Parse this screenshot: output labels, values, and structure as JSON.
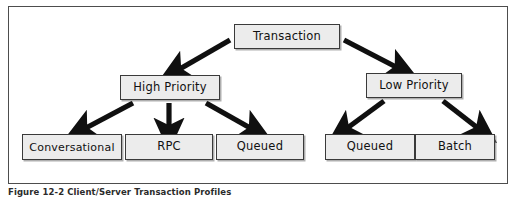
{
  "figure": {
    "caption": "Figure 12-2  Client/Server Transaction Profiles",
    "frame_color": "#4d4d4d",
    "background": "#ffffff"
  },
  "diagram": {
    "type": "tree",
    "box_fill": "#ececec",
    "box_border": "#3a3a3a",
    "arrow_color": "#101010",
    "root": {
      "id": "transaction",
      "label": "Transaction"
    },
    "levels": [
      {
        "name": "priority",
        "nodes": [
          {
            "id": "high-priority",
            "label": "High Priority"
          },
          {
            "id": "low-priority",
            "label": "Low Priority"
          }
        ]
      },
      {
        "name": "profiles",
        "nodes": [
          {
            "id": "conversational",
            "label": "Conversational",
            "parent": "high-priority"
          },
          {
            "id": "rpc",
            "label": "RPC",
            "parent": "high-priority"
          },
          {
            "id": "queued-high",
            "label": "Queued",
            "parent": "high-priority"
          },
          {
            "id": "queued-low",
            "label": "Queued",
            "parent": "low-priority"
          },
          {
            "id": "batch",
            "label": "Batch",
            "parent": "low-priority"
          }
        ]
      }
    ],
    "edges": [
      {
        "from": "transaction",
        "to": "high-priority"
      },
      {
        "from": "transaction",
        "to": "low-priority"
      },
      {
        "from": "high-priority",
        "to": "conversational"
      },
      {
        "from": "high-priority",
        "to": "rpc"
      },
      {
        "from": "high-priority",
        "to": "queued-high"
      },
      {
        "from": "low-priority",
        "to": "queued-low"
      },
      {
        "from": "low-priority",
        "to": "batch"
      }
    ]
  }
}
